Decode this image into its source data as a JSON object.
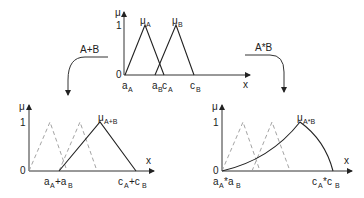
{
  "top_plot": {
    "y_axis_label": "μ",
    "x_axis_label": "x",
    "y_ticks": [
      "0",
      "1"
    ],
    "curve_labels": {
      "A": {
        "main": "μ",
        "sub": "A"
      },
      "B": {
        "main": "μ",
        "sub": "B"
      }
    },
    "x_ticks": [
      {
        "main": "a",
        "sub": "A"
      },
      {
        "main": "a",
        "sub": "B"
      },
      {
        "main": "c",
        "sub": "A"
      },
      {
        "main": "c",
        "sub": "B"
      }
    ]
  },
  "arrows": {
    "left": {
      "label": "A+B"
    },
    "right": {
      "label": "A*B"
    }
  },
  "bottom_left_plot": {
    "y_axis_label": "μ",
    "x_axis_label": "x",
    "y_ticks": [
      "0",
      "1"
    ],
    "curve_label": {
      "main": "μ",
      "sub": "A+B"
    },
    "x_ticks": [
      {
        "text": "a",
        "sub1": "A",
        "op": "+a",
        "sub2": "B"
      },
      {
        "text": "c",
        "sub1": "A",
        "op": "+c",
        "sub2": "B"
      }
    ]
  },
  "bottom_right_plot": {
    "y_axis_label": "μ",
    "x_axis_label": "x",
    "y_ticks": [
      "0",
      "1"
    ],
    "curve_label": {
      "main": "μ",
      "sub": "A*B"
    },
    "x_ticks": [
      {
        "text": "a",
        "sub1": "A",
        "op": "*a",
        "sub2": "B"
      },
      {
        "text": "c",
        "sub1": "A",
        "op": "*c",
        "sub2": "B"
      }
    ]
  }
}
